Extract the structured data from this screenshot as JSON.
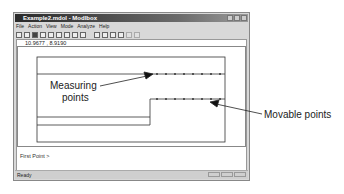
{
  "window": {
    "title": "Example2.mdol - Modlbox",
    "controls": [
      "minimize",
      "maximize",
      "close"
    ]
  },
  "menu": [
    "File",
    "Action",
    "View",
    "Mode",
    "Analyze",
    "Help"
  ],
  "toolbar": {
    "icons": [
      "new-file-icon",
      "open-file-icon",
      "save-icon",
      "select-icon",
      "line-icon",
      "rectangle-icon",
      "add-point-icon",
      "edit-icon",
      "help-icon",
      "zoom-icon",
      "circle-icon",
      "grid-icon",
      "grid-alt-icon",
      "disabled-icon-1",
      "disabled-icon-2"
    ]
  },
  "coords": "10.9677 ,  8.9190",
  "prompt": "First Point >",
  "status": {
    "text": "Ready"
  },
  "annotations": {
    "measuring": "Measuring\npoints",
    "measuring_line1": "Measuring",
    "measuring_line2": "points",
    "movable": "Movable points"
  }
}
